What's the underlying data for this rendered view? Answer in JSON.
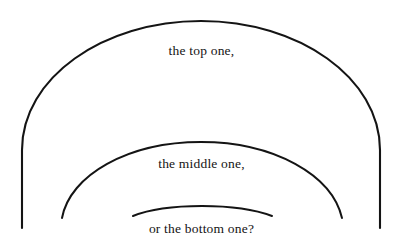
{
  "figure": {
    "background_color": "#ffffff",
    "stroke_color": "#141414",
    "text_color": "#141414",
    "width": 403,
    "height": 242,
    "labels": {
      "top": "the top one,",
      "middle": "the middle one,",
      "bottom": "or the bottom one?"
    },
    "arcs": [
      {
        "name": "outer-arc",
        "label_key": "top",
        "apex_x": 201,
        "apex_y": 21,
        "left_end_x": 22,
        "left_end_y": 228,
        "right_end_x": 380,
        "right_end_y": 228,
        "stroke_width": 2.1,
        "path": "M 22 228 L 22 150 C 22 78 103 21 201 21 C 299 21 380 78 380 150 L 380 228"
      },
      {
        "name": "middle-arc",
        "label_key": "middle",
        "apex_x": 201,
        "apex_y": 142,
        "left_end_x": 62,
        "left_end_y": 218,
        "right_end_x": 342,
        "right_end_y": 218,
        "stroke_width": 2.0,
        "path": "M 62 218 C 70 175 128 142 201 142 C 274 142 332 175 342 218"
      },
      {
        "name": "inner-arc",
        "label_key": "bottom",
        "apex_x": 202,
        "apex_y": 207,
        "left_end_x": 133,
        "left_end_y": 216,
        "right_end_x": 272,
        "right_end_y": 216,
        "stroke_width": 2.0,
        "path": "M 133 216 C 155 207 180 206 202 206 C 226 206 251 208 272 216"
      }
    ]
  }
}
